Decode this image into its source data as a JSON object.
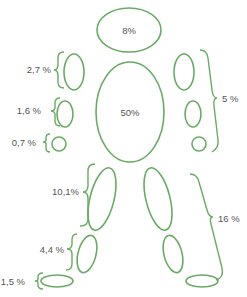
{
  "diagram": {
    "stroke_color": "#6aaa64",
    "text_color": "#555555",
    "segments": {
      "head": {
        "label": "8%"
      },
      "trunk": {
        "label": "50%"
      },
      "upper_arm": {
        "label": "2,7 %"
      },
      "forearm": {
        "label": "1,6 %"
      },
      "hand": {
        "label": "0,7 %"
      },
      "arm_total": {
        "label": "5 %"
      },
      "thigh": {
        "label": "10,1%"
      },
      "shank": {
        "label": "4,4 %"
      },
      "foot": {
        "label": "1,5 %"
      },
      "leg_total": {
        "label": "16 %"
      }
    }
  }
}
